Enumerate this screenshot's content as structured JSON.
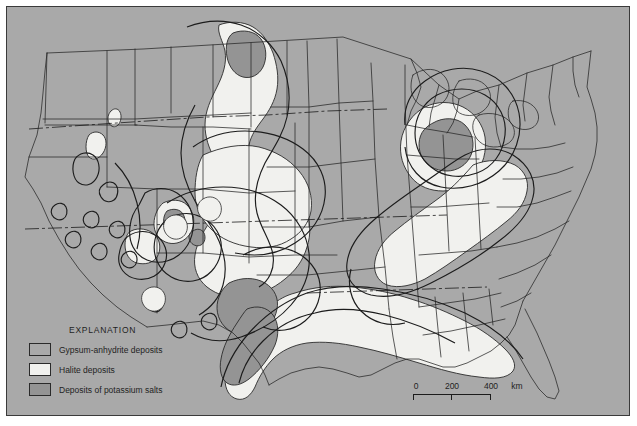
{
  "map": {
    "title": "Evaporite deposits of the conterminous United States",
    "background_color": "#a9a9a9",
    "frame_border_color": "#3a3a3a",
    "outline_color": "#1c1c1c"
  },
  "legend": {
    "title": "EXPLANATION",
    "items": [
      {
        "label": "Gypsum-anhydrite deposits",
        "color": "#a9a9a9",
        "swatch_name": "gypsum-anhydrite-swatch"
      },
      {
        "label": "Halite deposits",
        "color": "#f1f1ee",
        "swatch_name": "halite-swatch"
      },
      {
        "label": "Deposits of potassium salts",
        "color": "#949494",
        "swatch_name": "potassium-salts-swatch"
      }
    ]
  },
  "scale_bar": {
    "ticks": [
      "0",
      "200",
      "400"
    ],
    "unit": "km",
    "zero": "0",
    "two_hundred": "200",
    "four_hundred": "400"
  }
}
